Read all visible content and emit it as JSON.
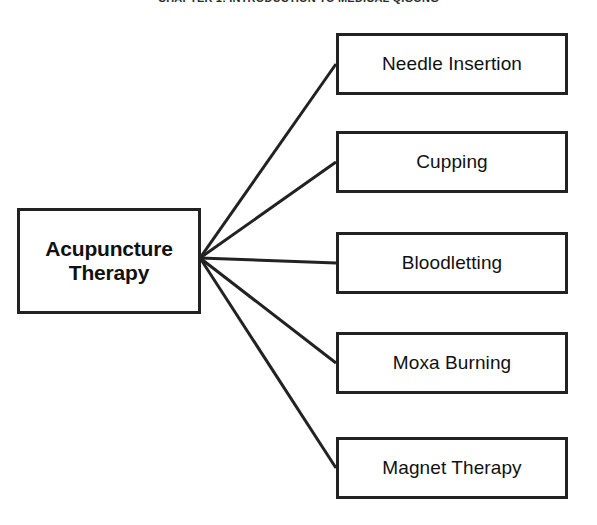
{
  "page": {
    "width": 597,
    "height": 525,
    "background_color": "#ffffff"
  },
  "header": {
    "text": "CHAPTER 1: INTRODUCTION TO MEDICAL QIGONG",
    "clipped": true
  },
  "diagram": {
    "type": "radial-tree",
    "line_color": "#222222",
    "box_border_color": "#222222",
    "box_fill_color": "#ffffff",
    "text_color": "#111111",
    "root": {
      "label_line_1": "Acupuncture",
      "label_line_2": "Therapy",
      "label_full": "Acupuncture Therapy",
      "bold": true
    },
    "fan_origin": {
      "x": 200,
      "y": 258
    },
    "children": [
      {
        "label": "Needle Insertion",
        "anchor_x": 336,
        "anchor_y": 64
      },
      {
        "label": "Cupping",
        "anchor_x": 336,
        "anchor_y": 162
      },
      {
        "label": "Bloodletting",
        "anchor_x": 336,
        "anchor_y": 263
      },
      {
        "label": "Moxa Burning",
        "anchor_x": 336,
        "anchor_y": 363
      },
      {
        "label": "Magnet Therapy",
        "anchor_x": 336,
        "anchor_y": 468
      }
    ]
  }
}
